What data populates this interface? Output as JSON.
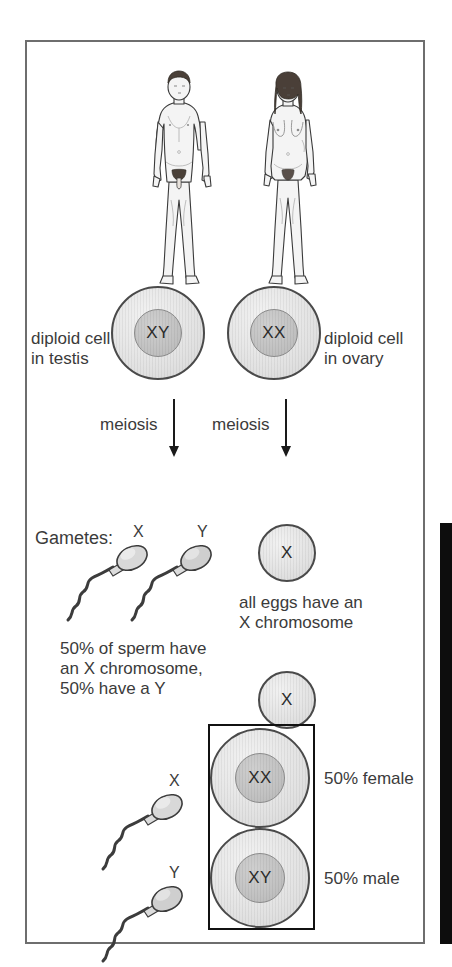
{
  "figure": {
    "frame": {
      "border_color": "#6e6e6e"
    }
  },
  "parents": [
    {
      "name": "male-figure",
      "sex": "male",
      "alt": "adult male human body figure"
    },
    {
      "name": "female-figure",
      "sex": "female",
      "alt": "adult female human body figure"
    }
  ],
  "diploid_cells": [
    {
      "chromosomes": "XY",
      "caption": "diploid cell\nin testis"
    },
    {
      "chromosomes": "XX",
      "caption": "diploid cell\nin ovary"
    }
  ],
  "meiosis": {
    "left_label": "meiosis",
    "right_label": "meiosis"
  },
  "gametes": {
    "heading": "Gametes:",
    "sperm": [
      {
        "chromosome": "X"
      },
      {
        "chromosome": "Y"
      }
    ],
    "sperm_caption": "50% of sperm have\nan X chromosome,\n50% have a Y",
    "egg": {
      "chromosome": "X"
    },
    "egg_caption": "all eggs have an\nX chromosome"
  },
  "fertilisation": {
    "egg": {
      "chromosome": "X"
    },
    "sperm": [
      {
        "chromosome": "X"
      },
      {
        "chromosome": "Y"
      }
    ],
    "offspring": [
      {
        "chromosomes": "XX",
        "outcome": "50% female"
      },
      {
        "chromosomes": "XY",
        "outcome": "50% male"
      }
    ]
  }
}
